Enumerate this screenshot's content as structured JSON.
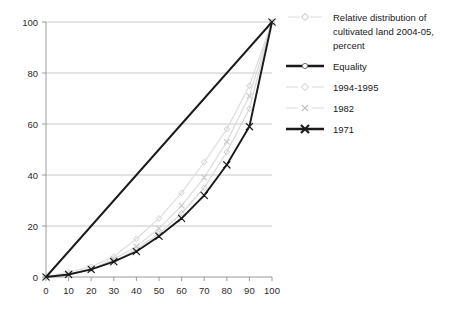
{
  "chart_data": {
    "type": "line",
    "title": "",
    "subtitle": "",
    "xlabel": "",
    "ylabel": "",
    "xlim": [
      0,
      100
    ],
    "ylim": [
      0,
      100
    ],
    "xticks": [
      0,
      10,
      20,
      30,
      40,
      50,
      60,
      70,
      80,
      90,
      100
    ],
    "yticks": [
      0,
      20,
      40,
      60,
      80,
      100
    ],
    "grid": "horizontal",
    "legend_position": "right",
    "legend_title": "Relative distribution of cultivated land 2004-05, percent",
    "x": [
      0,
      10,
      20,
      30,
      40,
      50,
      60,
      70,
      80,
      90,
      100
    ],
    "series": [
      {
        "name": "Equality",
        "color": "#1a1a1a",
        "marker": "circle",
        "line": "thick",
        "values": [
          0,
          10,
          20,
          30,
          40,
          50,
          60,
          70,
          80,
          90,
          100
        ]
      },
      {
        "name": "1994-1995",
        "color": "#d2d2d2",
        "marker": "diamond",
        "line": "thin",
        "values": [
          0,
          1,
          3,
          6,
          11,
          17,
          25,
          35,
          49,
          66,
          100
        ]
      },
      {
        "name": "1982",
        "color": "#c4c4c4",
        "marker": "cross",
        "line": "thin",
        "values": [
          0,
          1,
          3,
          7,
          12,
          19,
          28,
          39,
          53,
          71,
          100
        ]
      },
      {
        "name": "1971",
        "color": "#1a1a1a",
        "marker": "cross",
        "line": "thick",
        "values": [
          0,
          1,
          3,
          6,
          10,
          16,
          23,
          32,
          44,
          59,
          100
        ]
      }
    ],
    "series_upper_gray": {
      "name": "1994-1995-upper",
      "values": [
        0,
        2,
        4,
        8,
        15,
        23,
        33,
        45,
        58,
        75,
        100
      ]
    },
    "colors": {
      "axis": "#9a9a9a",
      "grid": "#c8c8c8",
      "dark": "#1a1a1a",
      "light_gray": "#d2d2d2",
      "mid_gray": "#bfbfbf",
      "text": "#2b2b2b",
      "background": "#ffffff"
    }
  },
  "legend": {
    "items": [
      {
        "label": "Relative distribution of cultivated land 2004-05, percent",
        "marker": "diamond",
        "style": "title"
      },
      {
        "label": "Equality",
        "marker": "circle",
        "style": "dark-thick"
      },
      {
        "label": "1994-1995",
        "marker": "diamond",
        "style": "light-thin"
      },
      {
        "label": "1982",
        "marker": "cross",
        "style": "light-thin"
      },
      {
        "label": "1971",
        "marker": "cross",
        "style": "dark-thick"
      }
    ],
    "title_lines": [
      "Relative distribution of",
      "cultivated land 2004-05,",
      "percent"
    ]
  }
}
